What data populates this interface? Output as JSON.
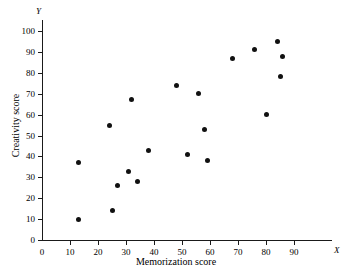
{
  "chart_data": {
    "type": "scatter",
    "title": "",
    "xlabel": "Memorization score",
    "ylabel": "Creativity score",
    "x_axis_letter": "X",
    "y_axis_letter": "Y",
    "xlim": [
      0,
      95
    ],
    "ylim": [
      0,
      105
    ],
    "xticks": [
      0,
      10,
      20,
      30,
      40,
      50,
      60,
      70,
      80,
      90
    ],
    "yticks": [
      0,
      10,
      20,
      30,
      40,
      50,
      60,
      70,
      80,
      90,
      100
    ],
    "grid": false,
    "legend": false,
    "marker_color": "#111111",
    "axis_color": "#1a1a1a",
    "points": [
      {
        "x": 13,
        "y": 37
      },
      {
        "x": 13,
        "y": 10
      },
      {
        "x": 24,
        "y": 55
      },
      {
        "x": 25,
        "y": 14
      },
      {
        "x": 27,
        "y": 26
      },
      {
        "x": 31,
        "y": 33
      },
      {
        "x": 32,
        "y": 67
      },
      {
        "x": 34,
        "y": 28
      },
      {
        "x": 38,
        "y": 43
      },
      {
        "x": 48,
        "y": 74
      },
      {
        "x": 52,
        "y": 41
      },
      {
        "x": 56,
        "y": 70
      },
      {
        "x": 58,
        "y": 53
      },
      {
        "x": 59,
        "y": 38
      },
      {
        "x": 68,
        "y": 87
      },
      {
        "x": 76,
        "y": 91
      },
      {
        "x": 84,
        "y": 95
      },
      {
        "x": 86,
        "y": 88
      },
      {
        "x": 85,
        "y": 78
      },
      {
        "x": 80,
        "y": 60
      }
    ]
  }
}
